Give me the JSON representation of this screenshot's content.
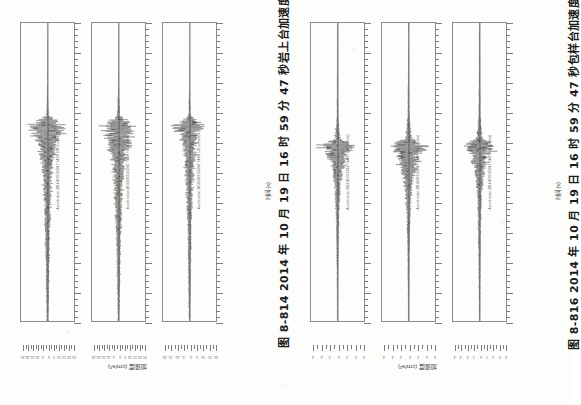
{
  "page": {
    "orientation": "rotated-90-ccw",
    "background_color": "#fdfdfc",
    "ink_color": "#1b1b1b",
    "scan_quality": "low-contrast photocopy"
  },
  "figures": [
    {
      "id": "fig-8-814",
      "caption": "图 8-814   2014 年 10 月 19 日 16 时 59 分 47 秒岩上台加速度记录",
      "caption_number": "图 8-814",
      "caption_text": "2014 年 10 月 19 日 16 时 59 分 47 秒岩上台加速度记录",
      "station": "岩上台",
      "event": "2014 年 10 月 19 日 16 时 59 分 47 秒",
      "x_axis_label": "时间 (s)",
      "y_axis_label": "加速度 (cm/s²)",
      "panels": [
        {
          "title": "Acceleration 20141019165947 YASH EW (cm/s/s)",
          "component": "EW",
          "tick_labels": [
            "0",
            "10",
            "20",
            "30",
            "40",
            "50",
            "60",
            "70",
            "80",
            "90"
          ],
          "y_tick_labels": [
            "-25",
            "-20",
            "-15",
            "-10",
            "-5",
            "0",
            "5",
            "10",
            "15",
            "20",
            "25"
          ]
        },
        {
          "title": "Acceleration 20141019165947 YASH NS (cm/s/s)",
          "component": "NS",
          "tick_labels": [
            "0",
            "10",
            "20",
            "30",
            "40",
            "50",
            "60",
            "70",
            "80",
            "90"
          ],
          "y_tick_labels": [
            "-25",
            "-20",
            "-15",
            "-10",
            "-5",
            "0",
            "5",
            "10",
            "15",
            "20",
            "25"
          ]
        },
        {
          "title": "Acceleration 20141019165947 YASH UD (cm/s/s)",
          "component": "UD",
          "tick_labels": [
            "0",
            "10",
            "20",
            "30",
            "40",
            "50",
            "60",
            "70",
            "80",
            "90"
          ],
          "y_tick_labels": [
            "-20",
            "-15",
            "-10",
            "-5",
            "0",
            "5",
            "10",
            "15",
            "20"
          ]
        }
      ]
    },
    {
      "id": "fig-8-816",
      "caption": "图 8-816   2014 年 10 月 19 日 16 时 59 分 47 秒包样台加速度记录",
      "caption_number": "图 8-816",
      "caption_text": "2014 年 10 月 19 日 16 时 59 分 47 秒包样台加速度记录",
      "station": "包样台",
      "event": "2014 年 10 月 19 日 16 时 59 分 47 秒",
      "x_axis_label": "时间 (s)",
      "y_axis_label": "加速度 (cm/s²)",
      "panels": [
        {
          "title": "Acceleration 20141019165947 BAOY EW (cm/s/s)",
          "component": "EW",
          "tick_labels": [
            "0",
            "10",
            "20",
            "30",
            "40",
            "50",
            "60",
            "70",
            "80",
            "90"
          ],
          "y_tick_labels": [
            "-6",
            "-4",
            "-2",
            "0",
            "2",
            "4",
            "6"
          ]
        },
        {
          "title": "Acceleration 20141019165947 BAOY NS (cm/s/s)",
          "component": "NS",
          "tick_labels": [
            "0",
            "10",
            "20",
            "30",
            "40",
            "50",
            "60",
            "70",
            "80",
            "90"
          ],
          "y_tick_labels": [
            "-6",
            "-4",
            "-2",
            "0",
            "2",
            "4",
            "6"
          ]
        },
        {
          "title": "Acceleration 20141019165947 BAOY UD (cm/s/s)",
          "component": "UD",
          "tick_labels": [
            "0",
            "10",
            "20",
            "30",
            "40",
            "50",
            "60",
            "70",
            "80",
            "90"
          ],
          "y_tick_labels": [
            "-4",
            "-3",
            "-2",
            "-1",
            "0",
            "1",
            "2",
            "3",
            "4"
          ]
        }
      ]
    }
  ],
  "chart_data": {
    "type": "line",
    "xlabel": "时间 (s)",
    "ylabel": "加速度 (cm/s²)",
    "xlim": [
      0,
      90
    ],
    "grid": false,
    "legend_position": "none",
    "note": "Six acceleration time-history traces; page is rotated 90° counter-clockwise so the time axis runs vertically.",
    "series": [
      {
        "name": "岩上台 EW",
        "figure": "图 8-814",
        "ylim": [
          -25,
          25
        ],
        "peak_amplitude": 24,
        "onset_time_s": 31,
        "coda_end_time_s": 88,
        "envelope": [
          {
            "t": 0,
            "a": 0.3
          },
          {
            "t": 10,
            "a": 0.4
          },
          {
            "t": 20,
            "a": 0.5
          },
          {
            "t": 28,
            "a": 1.5
          },
          {
            "t": 31,
            "a": 24
          },
          {
            "t": 34,
            "a": 17
          },
          {
            "t": 38,
            "a": 11
          },
          {
            "t": 44,
            "a": 7
          },
          {
            "t": 52,
            "a": 5
          },
          {
            "t": 62,
            "a": 3.5
          },
          {
            "t": 72,
            "a": 2.5
          },
          {
            "t": 82,
            "a": 1.8
          },
          {
            "t": 90,
            "a": 1.2
          }
        ]
      },
      {
        "name": "岩上台 NS",
        "figure": "图 8-814",
        "ylim": [
          -25,
          25
        ],
        "peak_amplitude": 22,
        "onset_time_s": 31,
        "coda_end_time_s": 88,
        "envelope": [
          {
            "t": 0,
            "a": 0.3
          },
          {
            "t": 10,
            "a": 0.4
          },
          {
            "t": 20,
            "a": 0.6
          },
          {
            "t": 28,
            "a": 2.0
          },
          {
            "t": 31,
            "a": 22
          },
          {
            "t": 35,
            "a": 16
          },
          {
            "t": 40,
            "a": 10
          },
          {
            "t": 46,
            "a": 7
          },
          {
            "t": 54,
            "a": 5
          },
          {
            "t": 64,
            "a": 3.2
          },
          {
            "t": 74,
            "a": 2.2
          },
          {
            "t": 84,
            "a": 1.5
          },
          {
            "t": 90,
            "a": 1.0
          }
        ]
      },
      {
        "name": "岩上台 UD",
        "figure": "图 8-814",
        "ylim": [
          -20,
          20
        ],
        "peak_amplitude": 15,
        "onset_time_s": 31,
        "coda_end_time_s": 82,
        "envelope": [
          {
            "t": 0,
            "a": 0.2
          },
          {
            "t": 10,
            "a": 0.3
          },
          {
            "t": 20,
            "a": 0.4
          },
          {
            "t": 28,
            "a": 1.2
          },
          {
            "t": 31,
            "a": 15
          },
          {
            "t": 34,
            "a": 10
          },
          {
            "t": 39,
            "a": 6.5
          },
          {
            "t": 45,
            "a": 4.5
          },
          {
            "t": 54,
            "a": 3
          },
          {
            "t": 64,
            "a": 2
          },
          {
            "t": 74,
            "a": 1.4
          },
          {
            "t": 84,
            "a": 1.0
          },
          {
            "t": 90,
            "a": 0.7
          }
        ]
      },
      {
        "name": "包样台 EW",
        "figure": "图 8-816",
        "ylim": [
          -6,
          6
        ],
        "peak_amplitude": 5.5,
        "onset_time_s": 37,
        "coda_end_time_s": 62,
        "envelope": [
          {
            "t": 0,
            "a": 0.12
          },
          {
            "t": 15,
            "a": 0.15
          },
          {
            "t": 28,
            "a": 0.25
          },
          {
            "t": 35,
            "a": 0.9
          },
          {
            "t": 37,
            "a": 5.5
          },
          {
            "t": 40,
            "a": 3.2
          },
          {
            "t": 44,
            "a": 1.8
          },
          {
            "t": 50,
            "a": 0.9
          },
          {
            "t": 58,
            "a": 0.5
          },
          {
            "t": 70,
            "a": 0.3
          },
          {
            "t": 82,
            "a": 0.2
          },
          {
            "t": 90,
            "a": 0.15
          }
        ]
      },
      {
        "name": "包样台 NS",
        "figure": "图 8-816",
        "ylim": [
          -6,
          6
        ],
        "peak_amplitude": 6.0,
        "onset_time_s": 37,
        "coda_end_time_s": 64,
        "envelope": [
          {
            "t": 0,
            "a": 0.12
          },
          {
            "t": 15,
            "a": 0.16
          },
          {
            "t": 28,
            "a": 0.3
          },
          {
            "t": 35,
            "a": 1.1
          },
          {
            "t": 37,
            "a": 6.0
          },
          {
            "t": 40,
            "a": 3.6
          },
          {
            "t": 45,
            "a": 2.0
          },
          {
            "t": 51,
            "a": 1.0
          },
          {
            "t": 59,
            "a": 0.55
          },
          {
            "t": 70,
            "a": 0.32
          },
          {
            "t": 82,
            "a": 0.2
          },
          {
            "t": 90,
            "a": 0.15
          }
        ]
      },
      {
        "name": "包样台 UD",
        "figure": "图 8-816",
        "ylim": [
          -4,
          4
        ],
        "peak_amplitude": 3.4,
        "onset_time_s": 37,
        "coda_end_time_s": 58,
        "envelope": [
          {
            "t": 0,
            "a": 0.1
          },
          {
            "t": 15,
            "a": 0.12
          },
          {
            "t": 28,
            "a": 0.2
          },
          {
            "t": 35,
            "a": 0.7
          },
          {
            "t": 37,
            "a": 3.4
          },
          {
            "t": 40,
            "a": 1.9
          },
          {
            "t": 44,
            "a": 1.1
          },
          {
            "t": 50,
            "a": 0.6
          },
          {
            "t": 58,
            "a": 0.35
          },
          {
            "t": 70,
            "a": 0.22
          },
          {
            "t": 82,
            "a": 0.15
          },
          {
            "t": 90,
            "a": 0.1
          }
        ]
      }
    ]
  }
}
